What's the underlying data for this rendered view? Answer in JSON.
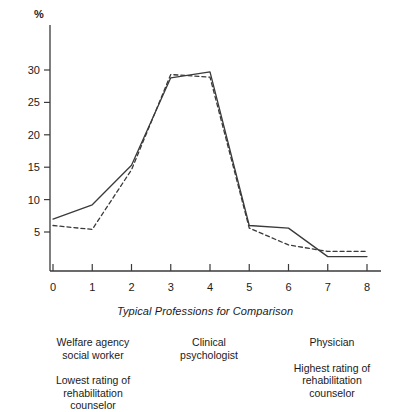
{
  "chart_data": {
    "type": "line",
    "title": "",
    "subtitle": "",
    "xlabel": "Typical Professions for Comparison",
    "ylabel": "%",
    "x": [
      0,
      1,
      2,
      3,
      4,
      5,
      6,
      7,
      8
    ],
    "xlim": [
      0,
      8
    ],
    "ylim": [
      0,
      32
    ],
    "yticks": [
      5,
      10,
      15,
      20,
      25,
      30
    ],
    "ytick_labels": [
      "5",
      "10",
      "15",
      "20",
      "25",
      "30"
    ],
    "xticks": [
      0,
      1,
      2,
      3,
      4,
      5,
      6,
      7,
      8
    ],
    "xtick_labels": [
      "0",
      "1",
      "2",
      "3",
      "4",
      "5",
      "6",
      "7",
      "8"
    ],
    "grid": false,
    "legend_position": "none",
    "series": [
      {
        "name": "solid-series",
        "style": "solid",
        "color": "#3a3a3a",
        "values": [
          7.0,
          9.2,
          15.3,
          28.8,
          29.7,
          6.0,
          5.6,
          1.2,
          1.2
        ]
      },
      {
        "name": "dashed-series",
        "style": "dashed",
        "color": "#3a3a3a",
        "values": [
          6.0,
          5.4,
          14.6,
          29.3,
          28.9,
          5.6,
          3.0,
          2.0,
          2.0
        ]
      }
    ],
    "annotations": []
  },
  "axis": {
    "y_unit_label": "%",
    "x_axis_title": "Typical Professions for Comparison"
  },
  "captions": {
    "left": {
      "profession": [
        "Welfare agency",
        "social worker"
      ],
      "rating": [
        "Lowest rating of",
        "rehabilitation",
        "counselor"
      ]
    },
    "middle": {
      "profession": [
        "Clinical",
        "psychologist"
      ],
      "rating": []
    },
    "right": {
      "profession": [
        "Physician"
      ],
      "rating": [
        "Highest rating of",
        "rehabilitation",
        "counselor"
      ]
    }
  },
  "colors": {
    "axis": "#3a3a3a",
    "line": "#3a3a3a",
    "text": "#1a1a1a",
    "background": "#ffffff"
  }
}
